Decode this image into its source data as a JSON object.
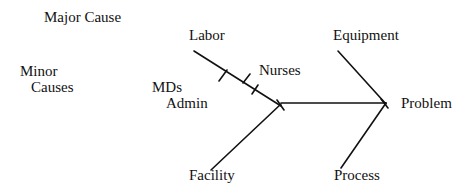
{
  "diagram": {
    "type": "fishbone",
    "legend": {
      "major_cause_label": "Major Cause",
      "minor_causes_line1": "Minor",
      "minor_causes_line2": "Causes"
    },
    "effect": "Problem",
    "major_causes": [
      {
        "label": "Labor",
        "minor_causes": [
          "MDs",
          "Admin",
          "Nurses"
        ]
      },
      {
        "label": "Equipment",
        "minor_causes": []
      },
      {
        "label": "Facility",
        "minor_causes": []
      },
      {
        "label": "Process",
        "minor_causes": []
      }
    ],
    "minor_labels": {
      "mds": "MDs",
      "admin": "Admin",
      "nurses": "Nurses"
    },
    "colors": {
      "line": "#111111",
      "text": "#111111",
      "background": "#ffffff"
    }
  }
}
